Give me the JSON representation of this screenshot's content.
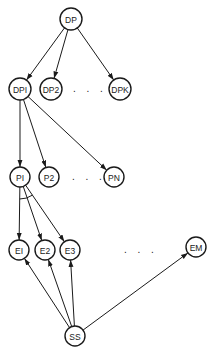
{
  "diagram": {
    "type": "tree-graph",
    "nodes": [
      {
        "id": "DP",
        "label": "DP",
        "x": 71,
        "y": 19,
        "r": 11
      },
      {
        "id": "DP1",
        "label": "DPI",
        "x": 20,
        "y": 89,
        "r": 11
      },
      {
        "id": "DP2",
        "label": "DP2",
        "x": 51,
        "y": 89,
        "r": 11
      },
      {
        "id": "DPK",
        "label": "DPK",
        "x": 120,
        "y": 89,
        "r": 11
      },
      {
        "id": "P1",
        "label": "PI",
        "x": 20,
        "y": 177,
        "r": 10
      },
      {
        "id": "P2",
        "label": "P2",
        "x": 49,
        "y": 177,
        "r": 10
      },
      {
        "id": "PN",
        "label": "PN",
        "x": 114,
        "y": 177,
        "r": 10
      },
      {
        "id": "E1",
        "label": "EI",
        "x": 19,
        "y": 250,
        "r": 10
      },
      {
        "id": "E2",
        "label": "E2",
        "x": 45,
        "y": 250,
        "r": 10
      },
      {
        "id": "E3",
        "label": "E3",
        "x": 70,
        "y": 250,
        "r": 10
      },
      {
        "id": "EM",
        "label": "EM",
        "x": 196,
        "y": 247,
        "r": 10
      },
      {
        "id": "SS",
        "label": "SS",
        "x": 75,
        "y": 336,
        "r": 10
      }
    ],
    "edges": [
      {
        "from": "DP",
        "to": "DP1"
      },
      {
        "from": "DP",
        "to": "DP2"
      },
      {
        "from": "DP",
        "to": "DPK"
      },
      {
        "from": "DP1",
        "to": "P1"
      },
      {
        "from": "DP1",
        "to": "P2"
      },
      {
        "from": "DP1",
        "to": "PN"
      },
      {
        "from": "P1",
        "to": "E1"
      },
      {
        "from": "P1",
        "to": "E2"
      },
      {
        "from": "P1",
        "to": "E3"
      },
      {
        "from": "SS",
        "to": "E1"
      },
      {
        "from": "SS",
        "to": "E2"
      },
      {
        "from": "SS",
        "to": "E3"
      },
      {
        "from": "SS",
        "to": "EM"
      }
    ],
    "ellipses": [
      {
        "label": ". . .",
        "x": 73,
        "y": 92
      },
      {
        "label": ". . .",
        "x": 72,
        "y": 180
      },
      {
        "label": ". . .",
        "x": 124,
        "y": 253
      }
    ],
    "and_arc": {
      "node": "P1",
      "radius": 22
    }
  }
}
